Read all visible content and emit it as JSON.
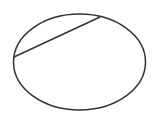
{
  "diagram": {
    "background": "#ffffff",
    "stroke_color": "#333333",
    "ellipse": {
      "cx": 79.5,
      "cy": 62,
      "rx": 66,
      "ry": 48,
      "stroke_width": 1.5
    },
    "chord": {
      "x1": 14,
      "y1": 57,
      "x2": 100,
      "y2": 17,
      "stroke_width": 1.5
    }
  }
}
